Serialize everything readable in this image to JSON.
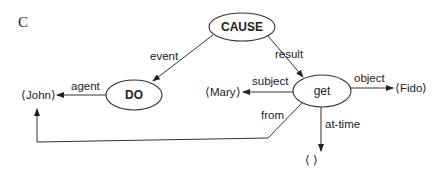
{
  "figure": {
    "panel_label": "C"
  },
  "nodes": {
    "cause": "CAUSE",
    "do": "DO",
    "get": "get"
  },
  "values": {
    "john": "⟨John⟩",
    "mary": "⟨Mary⟩",
    "fido": "⟨Fido⟩",
    "time": "⟨      ⟩"
  },
  "edges": {
    "event": "event",
    "result": "result",
    "agent": "agent",
    "subject": "subject",
    "object": "object",
    "from": "from",
    "at_time": "at-time"
  }
}
